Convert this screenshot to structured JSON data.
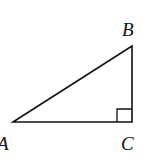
{
  "figure": {
    "type": "right-triangle",
    "vertices": {
      "A": {
        "label": "A",
        "x": 13,
        "y": 122
      },
      "B": {
        "label": "B",
        "x": 132,
        "y": 46
      },
      "C": {
        "label": "C",
        "x": 132,
        "y": 122
      }
    },
    "right_angle_at": "C",
    "stroke_color": "#111111"
  }
}
